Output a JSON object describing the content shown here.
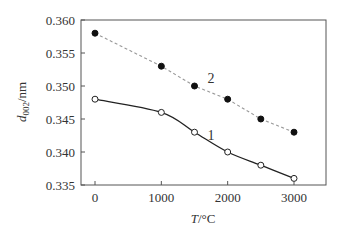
{
  "chart_data": {
    "type": "line",
    "title": "",
    "xlabel": "T/°C",
    "ylabel": "d002/nm",
    "ylabel_main": "d",
    "ylabel_sub": "002",
    "ylabel_unit": "/nm",
    "xlim": [
      -200,
      3300
    ],
    "ylim": [
      0.335,
      0.36
    ],
    "xticks": [
      0,
      1000,
      2000,
      3000
    ],
    "xtick_labels": [
      "0",
      "1000",
      "2000",
      "3000"
    ],
    "yticks": [
      0.335,
      0.34,
      0.345,
      0.35,
      0.355,
      0.36
    ],
    "ytick_labels": [
      "0.335",
      "0.340",
      "0.345",
      "0.350",
      "0.355",
      "0.360"
    ],
    "grid": false,
    "legend": "inline labels",
    "series": [
      {
        "name": "1",
        "marker": "open-circle",
        "line_style": "solid",
        "color": "#222222",
        "x": [
          0,
          1000,
          1500,
          2000,
          2500,
          3000
        ],
        "values": [
          0.348,
          0.346,
          0.343,
          0.34,
          0.338,
          0.336
        ],
        "label_pos": [
          1750,
          0.3418
        ]
      },
      {
        "name": "2",
        "marker": "filled-circle",
        "line_style": "dashed",
        "color": "#888888",
        "x": [
          0,
          1000,
          1500,
          2000,
          2500,
          3000
        ],
        "values": [
          0.358,
          0.353,
          0.35,
          0.348,
          0.345,
          0.343
        ],
        "label_pos": [
          1750,
          0.3505
        ]
      }
    ]
  }
}
